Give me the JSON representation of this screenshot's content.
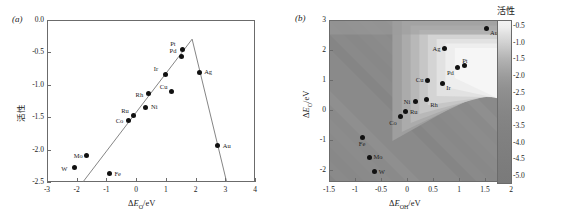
{
  "figure": {
    "panels": [
      {
        "tag": "(a)"
      },
      {
        "tag": "(b)"
      }
    ]
  },
  "chart_data": [
    {
      "type": "scatter",
      "panel": "(a)",
      "title": "",
      "xlabel": "ΔE_O/eV",
      "ylabel": "活性",
      "xlim": [
        -3,
        4
      ],
      "ylim": [
        -2.5,
        0.0
      ],
      "xticks": [
        -3,
        -2,
        -1,
        0,
        1,
        2,
        3,
        4
      ],
      "xtick_labels": [
        "-3",
        "-2",
        "-1",
        "0",
        "1",
        "2",
        "3",
        "4"
      ],
      "yticks": [
        0.0,
        -0.5,
        -1.0,
        -1.5,
        -2.0,
        -2.5
      ],
      "ytick_labels": [
        "0.0",
        "-0.5",
        "-1.0",
        "-1.5",
        "-2.0",
        "-2.5"
      ],
      "grid": false,
      "legend": "none",
      "annotation": "volcano plot: ascending and descending scaling lines meeting near ΔE_O = 1.85 eV",
      "points": [
        {
          "label": "W",
          "x": -2.08,
          "y": -2.28,
          "lbl_pos": "left"
        },
        {
          "label": "Mo",
          "x": -1.66,
          "y": -2.09,
          "lbl_pos": "left"
        },
        {
          "label": "Fe",
          "x": -0.9,
          "y": -2.37,
          "lbl_pos": "right"
        },
        {
          "label": "Co",
          "x": -0.25,
          "y": -1.55,
          "lbl_pos": "left"
        },
        {
          "label": "Ru",
          "x": -0.1,
          "y": -1.48,
          "lbl_pos": "above-left"
        },
        {
          "label": "Ni",
          "x": 0.33,
          "y": -1.35,
          "lbl_pos": "right"
        },
        {
          "label": "Rh",
          "x": 0.42,
          "y": -1.14,
          "lbl_pos": "left"
        },
        {
          "label": "Cu",
          "x": 1.2,
          "y": -1.11,
          "lbl_pos": "above-left"
        },
        {
          "label": "Ir",
          "x": 1.0,
          "y": -0.84,
          "lbl_pos": "above-left"
        },
        {
          "label": "Pd",
          "x": 1.53,
          "y": -0.56,
          "lbl_pos": "above-left"
        },
        {
          "label": "Pt",
          "x": 1.55,
          "y": -0.45,
          "lbl_pos": "above-left"
        },
        {
          "label": "Ag",
          "x": 2.12,
          "y": -0.81,
          "lbl_pos": "right"
        },
        {
          "label": "Au",
          "x": 2.75,
          "y": -1.94,
          "lbl_pos": "right"
        }
      ],
      "lines": [
        {
          "name": "ascending-branch",
          "x": [
            -1.85,
            1.85
          ],
          "y": [
            -2.5,
            -0.28
          ]
        },
        {
          "name": "descending-branch",
          "x": [
            1.85,
            3.02
          ],
          "y": [
            -0.28,
            -2.5
          ]
        }
      ]
    },
    {
      "type": "heatmap",
      "panel": "(b)",
      "title": "",
      "xlabel": "ΔE_OH/eV",
      "ylabel": "ΔE_O/eV",
      "xlim": [
        -1.5,
        2
      ],
      "ylim": [
        -2.4,
        3
      ],
      "xticks": [
        -1.5,
        -1,
        -0.5,
        0,
        0.5,
        1,
        1.5,
        2
      ],
      "xtick_labels": [
        "-1.5",
        "-1",
        "-0.5",
        "0",
        "0.5",
        "1",
        "1.5",
        "2"
      ],
      "yticks": [
        3,
        2,
        1,
        0,
        -1,
        -2
      ],
      "ytick_labels": [
        "3",
        "2",
        "1",
        "0",
        "-1",
        "-2"
      ],
      "grid": false,
      "colorbar": {
        "title": "活性",
        "ticks": [
          -0.5,
          -1.0,
          -1.5,
          -2.0,
          -2.5,
          -3.0,
          -3.5,
          -4.0,
          -4.5,
          -5.0
        ],
        "tick_labels": [
          "-0.5",
          "-1.0",
          "-1.5",
          "-2.0",
          "-2.5",
          "-3.0",
          "-3.5",
          "-4.0",
          "-4.5",
          "-5.0"
        ],
        "cmap": "grayscale-light-high",
        "position": "right"
      },
      "points": [
        {
          "label": "W",
          "x": -0.62,
          "y": -2.05,
          "lbl_pos": "right"
        },
        {
          "label": "Mo",
          "x": -0.72,
          "y": -1.58,
          "lbl_pos": "right"
        },
        {
          "label": "Fe",
          "x": -0.85,
          "y": -0.92,
          "lbl_pos": "below"
        },
        {
          "label": "Co",
          "x": -0.13,
          "y": -0.22,
          "lbl_pos": "below-left"
        },
        {
          "label": "Ru",
          "x": -0.02,
          "y": -0.06,
          "lbl_pos": "right"
        },
        {
          "label": "Ni",
          "x": 0.17,
          "y": 0.28,
          "lbl_pos": "left"
        },
        {
          "label": "Rh",
          "x": 0.37,
          "y": 0.35,
          "lbl_pos": "below-right"
        },
        {
          "label": "Cu",
          "x": 0.4,
          "y": 1.0,
          "lbl_pos": "left"
        },
        {
          "label": "Ir",
          "x": 0.68,
          "y": 0.9,
          "lbl_pos": "below-right"
        },
        {
          "label": "Ag",
          "x": 0.72,
          "y": 2.05,
          "lbl_pos": "left"
        },
        {
          "label": "Pd",
          "x": 0.98,
          "y": 1.42,
          "lbl_pos": "below-left"
        },
        {
          "label": "Pt",
          "x": 1.1,
          "y": 1.48,
          "lbl_pos": "above"
        },
        {
          "label": "Au",
          "x": 1.52,
          "y": 2.72,
          "lbl_pos": "below-right"
        }
      ]
    }
  ],
  "colors": {
    "point": "#111111",
    "axis": "#6b6b6b",
    "line": "#777777",
    "text": "#222222",
    "map_background": "#8a8a8a",
    "map_peak": "#f5f5f5"
  }
}
